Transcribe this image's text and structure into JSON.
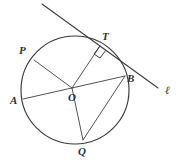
{
  "figure": {
    "kind": "circle-tangent-geometry-diagram",
    "background_color": "#ffffff",
    "ink_color": "#3b3b3f",
    "circle": {
      "center_label": "O",
      "center_x": 75,
      "center_y": 90,
      "radius": 54
    },
    "points": [
      {
        "name": "point-P",
        "label": "P",
        "x": 34,
        "y": 60,
        "label_x": 19,
        "label_y": 45
      },
      {
        "name": "point-T",
        "label": "T",
        "x": 100,
        "y": 46,
        "label_x": 102,
        "label_y": 31
      },
      {
        "name": "point-B",
        "label": "B",
        "x": 125,
        "y": 76,
        "label_x": 127,
        "label_y": 73
      },
      {
        "name": "point-A",
        "label": "A",
        "x": 23,
        "y": 99,
        "label_x": 10,
        "label_y": 95
      },
      {
        "name": "point-O",
        "label": "O",
        "x": 72,
        "y": 88,
        "label_x": 68,
        "label_y": 92
      },
      {
        "name": "point-Q",
        "label": "Q",
        "x": 83,
        "y": 140,
        "label_x": 78,
        "label_y": 146
      }
    ],
    "tangent_line": {
      "name": "tangent-line",
      "label": "ℓ",
      "label_x": 165,
      "label_y": 85,
      "x1": 42,
      "y1": 4,
      "x2": 158,
      "y2": 88,
      "touches_at": "T"
    },
    "segments": [
      {
        "name": "segment-A-B",
        "from": "A",
        "to": "B",
        "kind": "diameter"
      },
      {
        "name": "segment-P-O",
        "from": "P",
        "to": "O",
        "kind": "radius"
      },
      {
        "name": "segment-O-T",
        "from": "O",
        "to": "T",
        "kind": "radius"
      },
      {
        "name": "segment-O-Q",
        "from": "O",
        "to": "Q",
        "kind": "radius"
      },
      {
        "name": "segment-Q-B",
        "from": "Q",
        "to": "B",
        "kind": "chord"
      }
    ],
    "right_angle": {
      "name": "right-angle-mark",
      "at": "T",
      "between": [
        "segment-O-T",
        "tangent-line"
      ],
      "degrees": 90
    }
  }
}
